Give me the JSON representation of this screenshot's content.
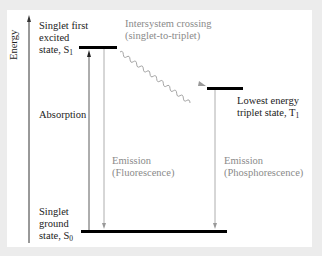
{
  "diagram": {
    "type": "Jablonski energy-level diagram",
    "axis_label": "Energy",
    "states": {
      "s1": {
        "line1": "Singlet first",
        "line2": "excited",
        "line3": "state, S",
        "sub": "1"
      },
      "t1": {
        "line1": "Lowest energy",
        "line2": "triplet state, T",
        "sub": "1"
      },
      "s0": {
        "line1": "Singlet",
        "line2": "ground",
        "line3": "state, S",
        "sub": "0"
      }
    },
    "transitions": {
      "absorption": "Absorption",
      "isc": {
        "line1": "Intersystem crossing",
        "line2": "(singlet-to-triplet)"
      },
      "fluorescence": {
        "line1": "Emission",
        "line2": "(Fluorescence)"
      },
      "phosphorescence": {
        "line1": "Emission",
        "line2": "(Phosphorescence)"
      }
    },
    "colors": {
      "levels": "#000000",
      "transition_gray": "#8a8a8a",
      "background": "#ececec",
      "panel": "#ffffff"
    }
  }
}
